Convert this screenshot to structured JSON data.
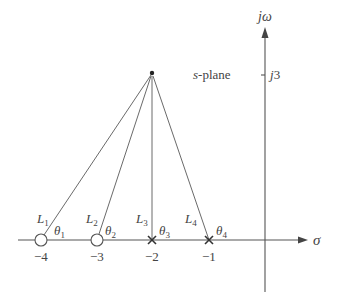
{
  "diagram": {
    "type": "s-plane pole-zero vector diagram",
    "plane_label": "s-plane",
    "axes": {
      "real": {
        "label": "σ"
      },
      "imag": {
        "label": "jω",
        "tick_label": "j3"
      }
    },
    "test_point": {
      "real": -2,
      "imag": 3
    },
    "zeros": [
      {
        "value": -4,
        "tick_label": "−4",
        "vector_label": "L",
        "vector_sub": "1",
        "angle_label": "θ",
        "angle_sub": "1"
      },
      {
        "value": -3,
        "tick_label": "−3",
        "vector_label": "L",
        "vector_sub": "2",
        "angle_label": "θ",
        "angle_sub": "2"
      }
    ],
    "poles": [
      {
        "value": -2,
        "tick_label": "−2",
        "vector_label": "L",
        "vector_sub": "3",
        "angle_label": "θ",
        "angle_sub": "3"
      },
      {
        "value": -1,
        "tick_label": "−1",
        "vector_label": "L",
        "vector_sub": "4",
        "angle_label": "θ",
        "angle_sub": "4"
      }
    ],
    "colors": {
      "line": "#6a6a6a",
      "axis": "#555555",
      "text": "#444444",
      "background": "#ffffff"
    }
  }
}
